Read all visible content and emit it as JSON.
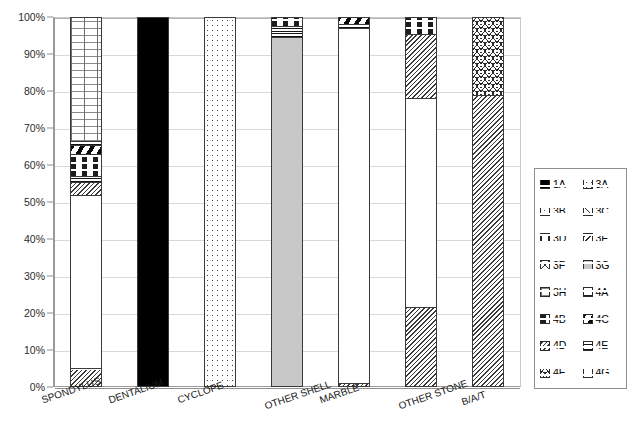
{
  "chart_data": {
    "type": "bar",
    "subtype": "stacked-100-percent",
    "title": "",
    "xlabel": "",
    "ylabel": "",
    "ylim": [
      0,
      100
    ],
    "ytick_labels": [
      "0%",
      "10%",
      "20%",
      "30%",
      "40%",
      "50%",
      "60%",
      "70%",
      "80%",
      "90%",
      "100%"
    ],
    "ytick_values": [
      0,
      10,
      20,
      30,
      40,
      50,
      60,
      70,
      80,
      90,
      100
    ],
    "grid": true,
    "legend_position": "right",
    "categories": [
      "SPONDYLUS",
      "DENTALIUM",
      "CYCLOPE",
      "OTHER SHELL",
      "MARBLE",
      "OTHER STONE",
      "B/A/T"
    ],
    "series": [
      {
        "name": "1A",
        "pattern": "solid-black",
        "values": [
          0,
          100,
          0,
          0,
          0,
          0,
          0
        ]
      },
      {
        "name": "3A",
        "pattern": "sparse-dots",
        "values": [
          0,
          0,
          100,
          0,
          0,
          0,
          0
        ]
      },
      {
        "name": "3B",
        "pattern": "fine-dots",
        "values": [
          0,
          0,
          0,
          0,
          0,
          0,
          0
        ]
      },
      {
        "name": "3C",
        "pattern": "back-diagonal-hatch",
        "values": [
          0,
          0,
          0,
          0,
          0,
          0,
          0
        ]
      },
      {
        "name": "3D",
        "pattern": "vertical-lines",
        "values": [
          0,
          0,
          0,
          0,
          0,
          0,
          0
        ]
      },
      {
        "name": "3E",
        "pattern": "forward-diagonal-hatch",
        "values": [
          0,
          0,
          0,
          0,
          0,
          0,
          0
        ]
      },
      {
        "name": "3F",
        "pattern": "cross-diagonal",
        "values": [
          0,
          0,
          0,
          0,
          0,
          0,
          0
        ]
      },
      {
        "name": "3G",
        "pattern": "light-grey-solid",
        "values": [
          0,
          0,
          0,
          94.5,
          0,
          0,
          0
        ]
      },
      {
        "name": "3H",
        "pattern": "grid-cross",
        "values": [
          33.5,
          0,
          0,
          0,
          0,
          0,
          0
        ]
      },
      {
        "name": "4A",
        "pattern": "fine-dash",
        "values": [
          0,
          0,
          0,
          0,
          0,
          0,
          0
        ]
      },
      {
        "name": "4B",
        "pattern": "horizontal-dashes",
        "values": [
          6.0,
          0,
          0,
          0,
          0,
          4.5,
          0
        ]
      },
      {
        "name": "4C",
        "pattern": "wide-black-diagonal",
        "values": [
          3.5,
          0,
          0,
          0,
          2.5,
          0,
          0
        ]
      },
      {
        "name": "4D",
        "pattern": "dense-diagonal-hatch",
        "values": [
          8.5,
          0,
          0,
          0,
          1.0,
          38.5,
          79.0
        ]
      },
      {
        "name": "4E",
        "pattern": "tight-horizontal-bands",
        "values": [
          1.5,
          0,
          0,
          5.5,
          0,
          0,
          0
        ]
      },
      {
        "name": "4F",
        "pattern": "wavy-scale",
        "values": [
          0,
          0,
          0,
          0,
          0,
          0,
          21.0
        ]
      },
      {
        "name": "4G",
        "pattern": "plain-white",
        "values": [
          47.0,
          0,
          0,
          0,
          96.5,
          56.5,
          0
        ]
      }
    ],
    "stacks": [
      {
        "category": "SPONDYLUS",
        "segments": [
          {
            "series": "4D",
            "from": 0,
            "to": 5.0
          },
          {
            "series": "4G",
            "from": 5.0,
            "to": 52.0
          },
          {
            "series": "4D",
            "from": 52.0,
            "to": 55.5
          },
          {
            "series": "4E",
            "from": 55.5,
            "to": 57.0
          },
          {
            "series": "4B",
            "from": 57.0,
            "to": 63.0
          },
          {
            "series": "4C",
            "from": 63.0,
            "to": 65.5
          },
          {
            "series": "4E",
            "from": 65.5,
            "to": 66.5
          },
          {
            "series": "3H",
            "from": 66.5,
            "to": 100
          }
        ]
      },
      {
        "category": "DENTALIUM",
        "segments": [
          {
            "series": "1A",
            "from": 0,
            "to": 100
          }
        ]
      },
      {
        "category": "CYCLOPE",
        "segments": [
          {
            "series": "3A",
            "from": 0,
            "to": 100
          }
        ]
      },
      {
        "category": "OTHER SHELL",
        "segments": [
          {
            "series": "3G",
            "from": 0,
            "to": 94.5
          },
          {
            "series": "4E",
            "from": 94.5,
            "to": 97.5
          },
          {
            "series": "4B",
            "from": 97.5,
            "to": 100
          }
        ]
      },
      {
        "category": "MARBLE",
        "segments": [
          {
            "series": "4D",
            "from": 0,
            "to": 1.0
          },
          {
            "series": "4G",
            "from": 1.0,
            "to": 97.0
          },
          {
            "series": "4E",
            "from": 97.0,
            "to": 98.0
          },
          {
            "series": "4C",
            "from": 98.0,
            "to": 100
          }
        ]
      },
      {
        "category": "OTHER STONE",
        "segments": [
          {
            "series": "4D",
            "from": 0,
            "to": 21.5
          },
          {
            "series": "4G",
            "from": 21.5,
            "to": 78.0
          },
          {
            "series": "4D",
            "from": 78.0,
            "to": 95.5
          },
          {
            "series": "4B",
            "from": 95.5,
            "to": 100
          }
        ]
      },
      {
        "category": "B/A/T",
        "segments": [
          {
            "series": "4D",
            "from": 0,
            "to": 79.0
          },
          {
            "series": "4F",
            "from": 79.0,
            "to": 100
          }
        ]
      }
    ]
  },
  "legend": {
    "entries": [
      {
        "key": "1A",
        "label": "1A",
        "pattern": "solid-black"
      },
      {
        "key": "3A",
        "label": "3A",
        "pattern": "sparse-dots"
      },
      {
        "key": "3B",
        "label": "3B",
        "pattern": "fine-dots"
      },
      {
        "key": "3C",
        "label": "3C",
        "pattern": "back-diagonal-hatch"
      },
      {
        "key": "3D",
        "label": "3D",
        "pattern": "vertical-lines"
      },
      {
        "key": "3E",
        "label": "3E",
        "pattern": "forward-diagonal-hatch"
      },
      {
        "key": "3F",
        "label": "3F",
        "pattern": "cross-diagonal"
      },
      {
        "key": "3G",
        "label": "3G",
        "pattern": "light-grey-solid"
      },
      {
        "key": "3H",
        "label": "3H",
        "pattern": "grid-cross"
      },
      {
        "key": "4A",
        "label": "4A",
        "pattern": "fine-dash"
      },
      {
        "key": "4B",
        "label": "4B",
        "pattern": "horizontal-dashes"
      },
      {
        "key": "4C",
        "label": "4C",
        "pattern": "wide-black-diagonal"
      },
      {
        "key": "4D",
        "label": "4D",
        "pattern": "dense-diagonal-hatch"
      },
      {
        "key": "4E",
        "label": "4E",
        "pattern": "tight-horizontal-bands"
      },
      {
        "key": "4F",
        "label": "4F",
        "pattern": "wavy-scale"
      },
      {
        "key": "4G",
        "label": "4G",
        "pattern": "plain-white"
      }
    ]
  },
  "colors": {
    "axis": "#8f8f8f",
    "gridline": "#d8d8d8",
    "bar_outline": "#3a3a3a",
    "text": "#1a1a1a",
    "grey_fill": "#c8c8c8",
    "black_fill": "#000000"
  }
}
